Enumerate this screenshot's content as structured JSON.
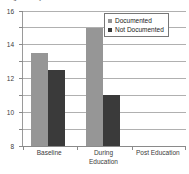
{
  "chart_data": {
    "type": "bar",
    "title": "Length of stay",
    "title_truncated": true,
    "categories": [
      "Baseline",
      "During Education",
      "Post Education"
    ],
    "series": [
      {
        "name": "Documented",
        "values": [
          11,
          14,
          0
        ],
        "color": "#969696"
      },
      {
        "name": "Not Documented",
        "values": [
          9,
          6,
          0
        ],
        "color": "#3a3a3a"
      }
    ],
    "xlabel": "",
    "ylabel": "",
    "ylim": [
      0,
      16
    ],
    "ytick_labels": [
      "0",
      "2",
      "4",
      "6",
      "8",
      "10",
      "12",
      "14",
      "16"
    ],
    "ytick_values": [
      0,
      2,
      4,
      6,
      8,
      10,
      12,
      14,
      16
    ],
    "grid": true,
    "legend_position": "top-right"
  },
  "axes": {
    "y_ticks": [
      {
        "label": "16",
        "value": 16
      },
      {
        "label": "14",
        "value": 14
      },
      {
        "label": "12",
        "value": 12
      },
      {
        "label": "10",
        "value": 10
      },
      {
        "label": "8",
        "value": 8
      },
      {
        "label": "6",
        "value": 6
      },
      {
        "label": "4",
        "value": 4
      },
      {
        "label": "2",
        "value": 2
      },
      {
        "label": "0",
        "value": 0
      }
    ],
    "x_categories": [
      {
        "line1": "Baseline",
        "line2": ""
      },
      {
        "line1": "During",
        "line2": "Education"
      },
      {
        "line1": "Post Education",
        "line2": ""
      }
    ]
  },
  "legend": {
    "entries": [
      {
        "label": "Documented",
        "color": "#969696"
      },
      {
        "label": "Not Documented",
        "color": "#3a3a3a"
      }
    ]
  },
  "bars": [
    {
      "category": "Baseline",
      "series": "Documented",
      "value": 11
    },
    {
      "category": "Baseline",
      "series": "Not Documented",
      "value": 9
    },
    {
      "category": "During Education",
      "series": "Documented",
      "value": 14
    },
    {
      "category": "During Education",
      "series": "Not Documented",
      "value": 6
    },
    {
      "category": "Post Education",
      "series": "Documented",
      "value": 0
    },
    {
      "category": "Post Education",
      "series": "Not Documented",
      "value": 0
    }
  ],
  "title": {
    "text": "Length of stay"
  }
}
